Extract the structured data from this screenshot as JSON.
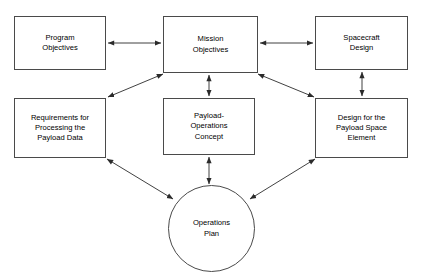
{
  "diagram": {
    "type": "flow-diagram",
    "background_color": "#ffffff",
    "line_color": "#2b2b2b",
    "box_border_color": "#4a4a4a",
    "text_color": "#000000",
    "nodes": [
      {
        "id": "program-objectives",
        "label": "Program\nObjectives",
        "shape": "rectangle",
        "x": 14,
        "y": 16,
        "w": 92,
        "h": 54
      },
      {
        "id": "mission-objectives",
        "label": "Mission\nObjectives",
        "shape": "rectangle",
        "x": 163,
        "y": 16,
        "w": 95,
        "h": 57
      },
      {
        "id": "spacecraft-design",
        "label": "Spacecraft\nDesign",
        "shape": "rectangle",
        "x": 315,
        "y": 16,
        "w": 93,
        "h": 54
      },
      {
        "id": "requirements-processing-payload-data",
        "label": "Requirements for\nProcessing the\nPayload Data",
        "shape": "rectangle",
        "x": 14,
        "y": 98,
        "w": 92,
        "h": 60
      },
      {
        "id": "payload-operations-concept",
        "label": "Payload-\nOperations\nConcept",
        "shape": "rectangle",
        "x": 163,
        "y": 98,
        "w": 92,
        "h": 57
      },
      {
        "id": "design-payload-space-element",
        "label": "Design for the\nPayload Space\nElement",
        "shape": "rectangle",
        "x": 315,
        "y": 98,
        "w": 93,
        "h": 60
      },
      {
        "id": "operations-plan",
        "label": "Operations\nPlan",
        "shape": "ellipse",
        "x": 168,
        "y": 185,
        "w": 87,
        "h": 87
      }
    ],
    "edges": [
      {
        "id": "program-to-mission",
        "from": "program-objectives",
        "to": "mission-objectives",
        "arrowheads": "both",
        "x1": 108,
        "y1": 43,
        "x2": 161,
        "y2": 43
      },
      {
        "id": "mission-to-spacecraft",
        "from": "mission-objectives",
        "to": "spacecraft-design",
        "arrowheads": "both",
        "x1": 260,
        "y1": 43,
        "x2": 313,
        "y2": 43
      },
      {
        "id": "mission-to-payload-operations",
        "from": "mission-objectives",
        "to": "payload-operations-concept",
        "arrowheads": "both",
        "x1": 209,
        "y1": 75,
        "x2": 209,
        "y2": 96
      },
      {
        "id": "spacecraft-to-design-payload",
        "from": "spacecraft-design",
        "to": "design-payload-space-element",
        "arrowheads": "both",
        "x1": 362,
        "y1": 72,
        "x2": 362,
        "y2": 96
      },
      {
        "id": "mission-to-requirements",
        "from": "mission-objectives",
        "to": "requirements-processing-payload-data",
        "arrowheads": "both",
        "x1": 163,
        "y1": 74,
        "x2": 108,
        "y2": 97
      },
      {
        "id": "mission-to-design-payload",
        "from": "mission-objectives",
        "to": "design-payload-space-element",
        "arrowheads": "both",
        "x1": 258,
        "y1": 74,
        "x2": 314,
        "y2": 97
      },
      {
        "id": "requirements-to-operations-plan",
        "from": "requirements-processing-payload-data",
        "to": "operations-plan",
        "arrowheads": "both",
        "x1": 107,
        "y1": 159,
        "x2": 173,
        "y2": 199
      },
      {
        "id": "payload-operations-to-operations-plan",
        "from": "payload-operations-concept",
        "to": "operations-plan",
        "arrowheads": "both",
        "x1": 209,
        "y1": 157,
        "x2": 209,
        "y2": 184
      },
      {
        "id": "design-payload-to-operations-plan",
        "from": "design-payload-space-element",
        "to": "operations-plan",
        "arrowheads": "both",
        "x1": 315,
        "y1": 159,
        "x2": 250,
        "y2": 199
      }
    ]
  }
}
